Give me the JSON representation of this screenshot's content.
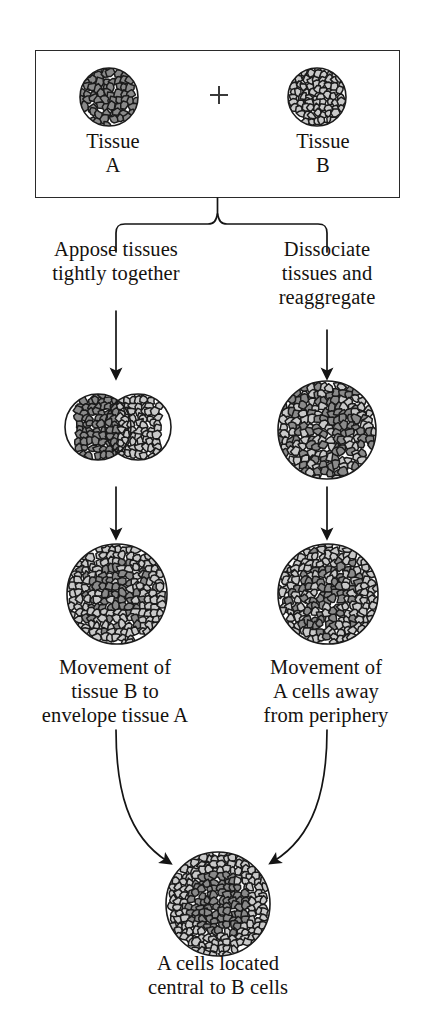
{
  "figure": {
    "type": "cell-sorting-flow-diagram"
  },
  "top_box": {
    "left_specimen": {
      "label": "Tissue\nA",
      "label_line1": "Tissue",
      "label_line2": "A",
      "cell_shade": "dark"
    },
    "operator": "+",
    "right_specimen": {
      "label": "Tissue\nB",
      "label_line1": "Tissue",
      "label_line2": "B",
      "cell_shade": "light"
    }
  },
  "branches": {
    "left": {
      "method_label": "Appose tissues\ntightly together",
      "stage_mid": "two-spheres-fused",
      "stage_low": "partially-sorted-sphere",
      "outcome_label": "Movement of\ntissue B to\nenvelope tissue A"
    },
    "right": {
      "method_label": "Dissociate\ntissues and\nreaggregate",
      "stage_mid": "randomly-mixed-sphere",
      "stage_low": "partially-sorted-sphere",
      "outcome_label": "Movement of\nA cells away\nfrom periphery"
    }
  },
  "result": {
    "label": "A cells located\ncentral to B cells",
    "structure": "dark-core-light-rim"
  },
  "colors": {
    "cell_dark": "#8a8a8a",
    "cell_light": "#c9c9c9",
    "cell_border": "#1b1b1b",
    "ink": "#15120f",
    "box_border": "#2a2a2a",
    "background": "#ffffff"
  }
}
